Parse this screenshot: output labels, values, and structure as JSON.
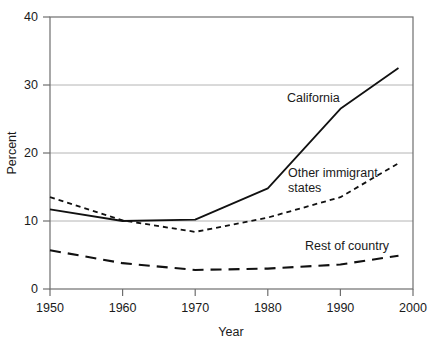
{
  "chart_data": {
    "type": "line",
    "title": "",
    "xlabel": "Year",
    "ylabel": "Percent",
    "xlim": [
      1950,
      2000
    ],
    "ylim": [
      0,
      40
    ],
    "grid": true,
    "grid_axis": "y",
    "legend_position": "inline-annotations",
    "x_ticks": [
      1950,
      1960,
      1970,
      1980,
      1990,
      2000
    ],
    "x_tick_labels": [
      "1950",
      "1960",
      "1970",
      "1980",
      "1990",
      "2000"
    ],
    "y_ticks": [
      0,
      10,
      20,
      30,
      40
    ],
    "y_tick_labels": [
      "0",
      "10",
      "20",
      "30",
      "40"
    ],
    "x": [
      1950,
      1960,
      1970,
      1980,
      1990,
      1998
    ],
    "series": [
      {
        "name": "California",
        "style": "solid",
        "color": "#111111",
        "values": [
          11.7,
          10.0,
          10.2,
          14.8,
          26.5,
          32.5
        ],
        "label": "California",
        "label_x": 1981,
        "label_y": 28.5
      },
      {
        "name": "Other immigrant states",
        "style": "dotted",
        "color": "#111111",
        "values": [
          13.5,
          10.1,
          8.4,
          10.5,
          13.5,
          18.5
        ],
        "label": "Other immigrant states",
        "label_line1": "Other immigrant",
        "label_line2": "states",
        "label_x": 1980.5,
        "label_y": 19.0
      },
      {
        "name": "Rest of country",
        "style": "dashed",
        "color": "#111111",
        "values": [
          5.7,
          3.8,
          2.8,
          3.0,
          3.6,
          4.9
        ],
        "label": "Rest of country",
        "label_x": 1980.5,
        "label_y": 7.4
      }
    ]
  },
  "axes": {
    "x_title": "Year",
    "y_title": "Percent"
  },
  "labels": {
    "california": "California",
    "other_immigrant_line1": "Other immigrant",
    "other_immigrant_line2": "states",
    "rest_of_country": "Rest of country"
  },
  "x_tick_labels": {
    "t0": "1950",
    "t1": "1960",
    "t2": "1970",
    "t3": "1980",
    "t4": "1990",
    "t5": "2000"
  },
  "y_tick_labels": {
    "t0": "0",
    "t1": "10",
    "t2": "20",
    "t3": "30",
    "t4": "40"
  }
}
